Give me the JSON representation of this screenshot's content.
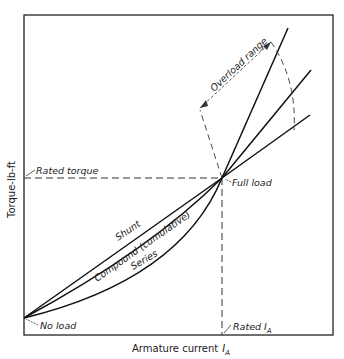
{
  "diagram": {
    "y_axis_label": "Torque-lb-ft",
    "x_axis_label": "Armature current",
    "x_axis_symbol": "I",
    "x_axis_subscript": "A",
    "annotations": {
      "rated_torque": "Rated torque",
      "full_load": "Full load",
      "no_load": "No load",
      "rated_current": "Rated I",
      "rated_current_subscript": "A",
      "overload_range": "Overload range"
    },
    "curves": [
      {
        "name": "Shunt",
        "label": "Shunt"
      },
      {
        "name": "Compound",
        "label": "Compound (cumulative)"
      },
      {
        "name": "Series",
        "label": "Series"
      }
    ]
  }
}
